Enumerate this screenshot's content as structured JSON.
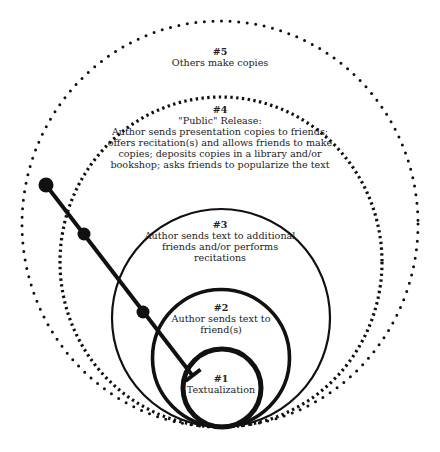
{
  "diagram": {
    "type": "nested-circles-stages",
    "colors": {
      "stroke": "#111111",
      "text": "#222222",
      "background": "#ffffff"
    },
    "stages": [
      {
        "id": 1,
        "number": "#1",
        "lines": [
          "Textualization"
        ],
        "style": "solid-thickest"
      },
      {
        "id": 2,
        "number": "#2",
        "lines": [
          "Author sends text to",
          "friend(s)"
        ],
        "style": "solid-thick"
      },
      {
        "id": 3,
        "number": "#3",
        "lines": [
          "Author sends text to additional",
          "friends and/or performs",
          "recitations"
        ],
        "style": "solid"
      },
      {
        "id": 4,
        "number": "#4",
        "lines": [
          "\"Public\" Release:",
          "Author sends presentation copies to friends;",
          "offers recitation(s) and allows friends to make",
          "copies; deposits copies in a library and/or",
          "bookshop; asks friends to popularize the text"
        ],
        "style": "dotted-dense"
      },
      {
        "id": 5,
        "number": "#5",
        "lines": [
          "Others make copies"
        ],
        "style": "dotted-sparse"
      }
    ],
    "timeline": {
      "description": "diagonal line with three circular nodes ending in a T-bar inside stage #1",
      "nodes": 3,
      "end_marker": "t-bar"
    }
  }
}
